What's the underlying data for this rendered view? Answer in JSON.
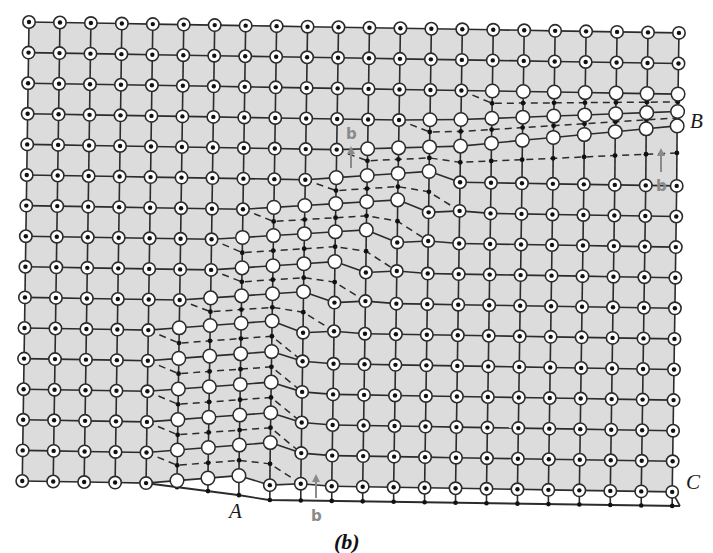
{
  "figure": {
    "caption": "(b)",
    "colors": {
      "background": "#ffffff",
      "lattice_fill": "#dcdcdc",
      "bond": "#2b2b2b",
      "atom_ring": "#2b2b2b",
      "atom_fill": "#ffffff",
      "atom_core": "#111111",
      "dash": "#2b2b2b",
      "burgers": "#8a8a8a"
    },
    "lattice": {
      "rows": 16,
      "cols": 22,
      "origin_x": 29,
      "origin_y": 22,
      "col_spacing": 30.95,
      "row_spacing": 30.6,
      "x_shear_per_row": -0.45,
      "y_drift_per_col": 0.52,
      "atom_radius": 6.2,
      "core_radius": 2.2
    },
    "dislocations": [
      {
        "row": 2,
        "white_from": 15,
        "white_to": 21,
        "end_col": 22,
        "step": 0.0
      },
      {
        "row": 3,
        "white_from": 13,
        "white_to": 21,
        "end_col": 22,
        "step": 0.8
      },
      {
        "row": 4,
        "white_from": 11,
        "white_to": 21,
        "end_col": 22,
        "step": 1.4
      },
      {
        "row": 5,
        "white_from": 10,
        "white_to": 13,
        "end_col": 14,
        "step": 2.6
      },
      {
        "row": 6,
        "white_from": 8,
        "white_to": 12,
        "end_col": 13,
        "step": 2.4
      },
      {
        "row": 7,
        "white_from": 7,
        "white_to": 11,
        "end_col": 12,
        "step": 2.4
      },
      {
        "row": 8,
        "white_from": 7,
        "white_to": 10,
        "end_col": 11,
        "step": 2.6
      },
      {
        "row": 9,
        "white_from": 6,
        "white_to": 9,
        "end_col": 10,
        "step": 2.6
      },
      {
        "row": 10,
        "white_from": 5,
        "white_to": 8,
        "end_col": 9,
        "step": 2.8
      },
      {
        "row": 11,
        "white_from": 5,
        "white_to": 8,
        "end_col": 9,
        "step": 2.8
      },
      {
        "row": 12,
        "white_from": 5,
        "white_to": 8,
        "end_col": 9,
        "step": 2.8
      },
      {
        "row": 13,
        "white_from": 5,
        "white_to": 8,
        "end_col": 9,
        "step": 2.8
      },
      {
        "row": 14,
        "white_from": 5,
        "white_to": 8,
        "end_col": 9,
        "step": 3.0
      }
    ],
    "bottom_row": {
      "row": 15,
      "white_from": 5,
      "white_to": 7,
      "step": 3.0
    },
    "right_edge_compression": {
      "2": 0,
      "3": -6,
      "4": -14
    },
    "bottom_edge": {
      "points": [
        [
          145,
          483
        ],
        [
          176,
          487
        ],
        [
          207,
          491
        ],
        [
          238,
          495
        ],
        [
          269,
          500
        ],
        [
          680,
          506
        ]
      ],
      "dot_cols_from": 5,
      "dot_cols_to": 21
    },
    "labels": {
      "B": {
        "text": "B",
        "x": 690,
        "y": 128
      },
      "C": {
        "text": "C",
        "x": 686,
        "y": 489
      },
      "A": {
        "text": "A",
        "x": 229,
        "y": 518
      }
    },
    "burgers_vectors": [
      {
        "label": "b",
        "label_x": 346,
        "label_y": 139,
        "x": 351,
        "y1": 168,
        "y2": 146
      },
      {
        "label": "b",
        "label_x": 656,
        "label_y": 191,
        "x": 661,
        "y1": 172,
        "y2": 148
      },
      {
        "label": "b",
        "label_x": 311,
        "label_y": 521,
        "x": 316,
        "y1": 498,
        "y2": 474
      }
    ],
    "caption_pos": {
      "x": 334,
      "y": 549
    }
  }
}
